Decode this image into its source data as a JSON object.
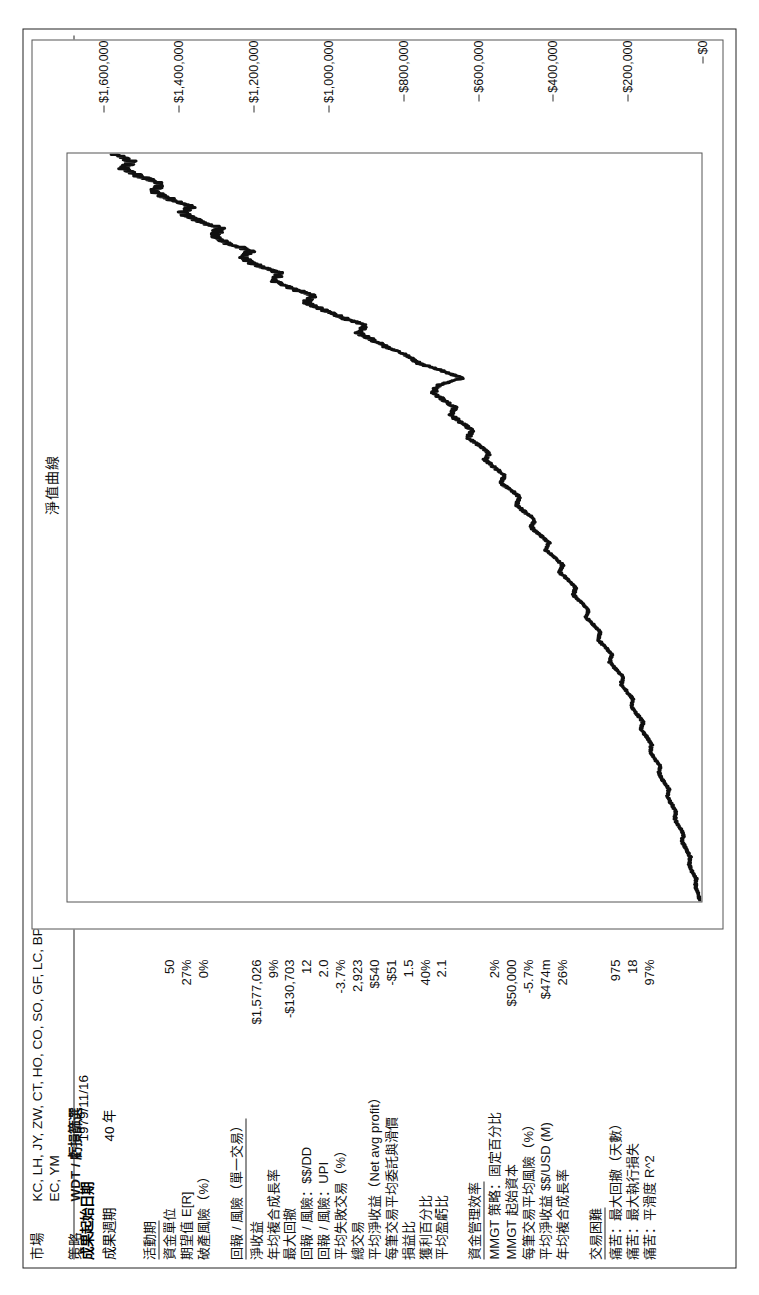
{
  "header": {
    "market_label": "市場",
    "market_value": "KC, LH, JY, ZW, CT, HO, CO, SO, GF, LC, BP, SB, ZB, HG, GC, SV, TY, SP, CL, FV, NG, ND, EC, YM",
    "strategy_label": "策略",
    "strategy_value": "WDT / 虧損篩選",
    "start_date_label": "成果起始日期",
    "start_date_value": "1979/11/16",
    "period_label": "成果週期",
    "period_value": "40 年"
  },
  "stats": {
    "activity": {
      "title": "活動期",
      "rows": [
        {
          "label": "資金單位",
          "value": "50"
        },
        {
          "label": "期望值 E[R]",
          "value": "27%"
        },
        {
          "label": "破產風險（%）",
          "value": "0%"
        }
      ]
    },
    "return_risk": {
      "title": "回報 / 風險（單一交易）",
      "rows": [
        {
          "label": "淨收益",
          "value": "$1,577,026"
        },
        {
          "label": "年均複合成長率",
          "value": "9%"
        },
        {
          "label": "最大回撤",
          "value": "-$130,703"
        },
        {
          "label": "回報 / 風險：$$/DD",
          "value": "12"
        },
        {
          "label": "回報 / 風險：UPI",
          "value": "2.0"
        },
        {
          "label": "平均失敗交易（%）",
          "value": "-3.7%"
        },
        {
          "label": "總交易",
          "value": "2,923"
        },
        {
          "label": "平均淨收益（Net avg profit）",
          "value": "$540"
        },
        {
          "label": "每筆交易平均委託與滑價",
          "value": "-$51"
        },
        {
          "label": "損益比",
          "value": "1.5"
        },
        {
          "label": "獲利百分比",
          "value": "40%"
        },
        {
          "label": "平均盈虧比",
          "value": "2.1"
        }
      ]
    },
    "money_mgmt": {
      "title": "資金管理效率",
      "rows": [
        {
          "label": "MMGT 策略：固定百分比",
          "value": "2%"
        },
        {
          "label": "MMGT 起始資本",
          "value": "$50,000"
        },
        {
          "label": "每筆交易平均風險（%）",
          "value": "-5.7%"
        },
        {
          "label": "平均淨收益 $$/USD (M)",
          "value": "$474m"
        },
        {
          "label": "年均複合成長率",
          "value": "26%"
        }
      ]
    },
    "difficulty": {
      "title": "交易困難",
      "rows": [
        {
          "label": "痛苦：最大回撤（天數）",
          "value": "975"
        },
        {
          "label": "痛苦：最大執行損失",
          "value": "18"
        },
        {
          "label": "痛苦：平滑度 R^2",
          "value": "97%"
        }
      ]
    }
  },
  "chart_data": {
    "type": "line",
    "title": "淨值曲線",
    "xlabel": "",
    "ylabel": "",
    "ylim": [
      0,
      1700000
    ],
    "ytick_labels": [
      "$0",
      "$200,000",
      "$400,000",
      "$600,000",
      "$800,000",
      "$1,000,000",
      "$1,200,000",
      "$1,400,000",
      "$1,600,000"
    ],
    "ytick_values": [
      0,
      200000,
      400000,
      600000,
      800000,
      1000000,
      1200000,
      1400000,
      1600000
    ],
    "grid": false,
    "legend": "none",
    "series": [
      {
        "name": "淨值曲線",
        "x": [
          0,
          1,
          2,
          3,
          4,
          5,
          6,
          7,
          8,
          9,
          10,
          11,
          12,
          13,
          14,
          15,
          16,
          17,
          18,
          19,
          20,
          21,
          22,
          23,
          24,
          25,
          26,
          27,
          28,
          29,
          30,
          31,
          32,
          33,
          34,
          35,
          36,
          37,
          38,
          39,
          40,
          41,
          42,
          43,
          44,
          45,
          46,
          47,
          48,
          49,
          50,
          51,
          52,
          53,
          54,
          55,
          56,
          57,
          58,
          59,
          60,
          61,
          62,
          63,
          64,
          65,
          66,
          67,
          68,
          69,
          70,
          71,
          72,
          73,
          74,
          75,
          76,
          77,
          78,
          79,
          80,
          81,
          82,
          83,
          84,
          85,
          86,
          87,
          88,
          89,
          90,
          91,
          92,
          93,
          94,
          95,
          96,
          97,
          98,
          99,
          100
        ],
        "values": [
          2000,
          9000,
          16000,
          14000,
          25000,
          33000,
          30000,
          42000,
          52000,
          48000,
          60000,
          71000,
          68000,
          80000,
          92000,
          88000,
          101000,
          114000,
          110000,
          124000,
          138000,
          133000,
          147000,
          162000,
          157000,
          172000,
          188000,
          183000,
          199000,
          216000,
          210000,
          228000,
          246000,
          240000,
          258000,
          277000,
          271000,
          290000,
          310000,
          303000,
          323000,
          344000,
          337000,
          358000,
          380000,
          372000,
          394000,
          417000,
          409000,
          432000,
          456000,
          447000,
          471000,
          496000,
          487000,
          512000,
          538000,
          528000,
          554000,
          581000,
          570000,
          598000,
          626000,
          614000,
          643000,
          672000,
          660000,
          690000,
          720000,
          705000,
          640000,
          700000,
          760000,
          790000,
          840000,
          880000,
          920000,
          900000,
          960000,
          1010000,
          1060000,
          1040000,
          1100000,
          1150000,
          1130000,
          1190000,
          1230000,
          1210000,
          1270000,
          1310000,
          1290000,
          1350000,
          1390000,
          1370000,
          1430000,
          1470000,
          1450000,
          1510000,
          1550000,
          1530000,
          1577026
        ]
      }
    ]
  }
}
